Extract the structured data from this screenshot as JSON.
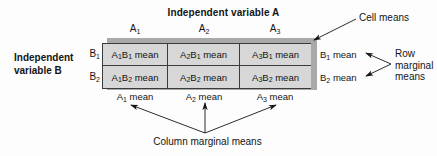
{
  "diagram": {
    "title": "Independent variable A",
    "row_axis_label_line1": "Independent",
    "row_axis_label_line2": "variable B",
    "column_headers": [
      "A1",
      "A2",
      "A3"
    ],
    "row_headers": [
      "B1",
      "B2"
    ],
    "cells": [
      [
        "A1B1 mean",
        "A2B1 mean",
        "A3B1 mean"
      ],
      [
        "A1B2 mean",
        "A2B2 mean",
        "A3B2 mean"
      ]
    ],
    "row_marginals": [
      "B1 mean",
      "B2 mean"
    ],
    "column_marginals": [
      "A1 mean",
      "A2 mean",
      "A3 mean"
    ],
    "annotations": {
      "cell_means": "Cell means",
      "row_marginal_means_line1": "Row",
      "row_marginal_means_line2": "marginal",
      "row_marginal_means_line3": "means",
      "column_marginal_means": "Column marginal means"
    },
    "colors": {
      "cell_fill": "#d7d7d7",
      "table_border": "#3b3b3b",
      "shadow": "#a9a9a9",
      "text": "#141414",
      "background": "#fdfdfd"
    }
  }
}
